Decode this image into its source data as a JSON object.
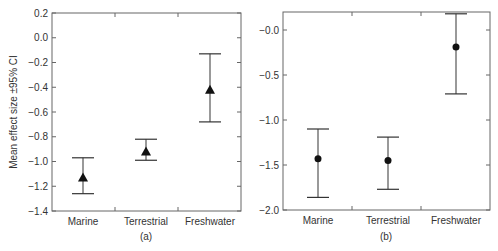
{
  "chart_data": [
    {
      "type": "scatter",
      "panel_label": "(a)",
      "ylabel": "Mean effect size ±95% CI",
      "xlabel": "",
      "categories": [
        "Marine",
        "Terrestrial",
        "Freshwater"
      ],
      "marker": "triangle",
      "values": [
        -1.13,
        -0.92,
        -0.42
      ],
      "ci_upper": [
        -0.97,
        -0.82,
        -0.13
      ],
      "ci_lower": [
        -1.26,
        -0.99,
        -0.68
      ],
      "ylim": [
        -1.4,
        0.2
      ],
      "yticks": [
        "0.2",
        "0.0",
        "−0.2",
        "−0.4",
        "−0.6",
        "−0.8",
        "−1.0",
        "−1.2",
        "−1.4"
      ],
      "grid": false
    },
    {
      "type": "scatter",
      "panel_label": "(b)",
      "ylabel": "",
      "xlabel": "",
      "categories": [
        "Marine",
        "Terrestrial",
        "Freshwater"
      ],
      "marker": "circle",
      "values": [
        -1.43,
        -1.45,
        -0.19
      ],
      "ci_upper": [
        -1.1,
        -1.19,
        0.18
      ],
      "ci_lower": [
        -1.86,
        -1.77,
        -0.71
      ],
      "ylim": [
        -2.0,
        0.2
      ],
      "yticks": [
        "−0.0",
        "−0.5",
        "−1.0",
        "−1.5",
        "−2.0"
      ],
      "grid": false
    }
  ]
}
